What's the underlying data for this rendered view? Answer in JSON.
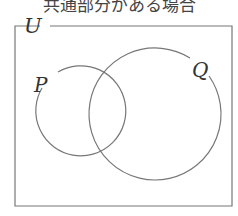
{
  "caption": "共通部分がある場合",
  "diagram": {
    "universe_label": "U",
    "set_p_label": "P",
    "set_q_label": "Q",
    "line_color": "#777777"
  }
}
